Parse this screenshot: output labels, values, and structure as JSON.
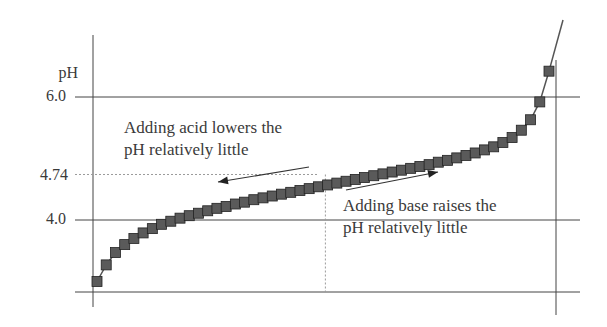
{
  "chart_data": {
    "type": "line",
    "title": "",
    "xlabel": "",
    "ylabel": "pH",
    "ylim": [
      2.83,
      7.0
    ],
    "y_ticks": [
      {
        "label": "6.0",
        "value": 6.0,
        "style": "solid"
      },
      {
        "label": "4.74",
        "value": 4.74,
        "style": "dashed"
      },
      {
        "label": "4.0",
        "value": 4.0,
        "style": "solid"
      }
    ],
    "grid": false,
    "legend": null,
    "marker": "square",
    "colors": {
      "marker_fill": "#5a5a5a",
      "marker_edge": "#222222",
      "line": "#555555",
      "axes": "#444444",
      "dashed": "#9a9a9a"
    },
    "series": [
      {
        "name": "buffer titration curve",
        "x": [
          0,
          1,
          2,
          3,
          4,
          5,
          6,
          7,
          8,
          9,
          10,
          11,
          12,
          13,
          14,
          15,
          16,
          17,
          18,
          19,
          20,
          21,
          22,
          23,
          24,
          25,
          26,
          27,
          28,
          29,
          30,
          31,
          32,
          33,
          34,
          35,
          36,
          37,
          38,
          39,
          40,
          41,
          42,
          43,
          44,
          45,
          46,
          47,
          48,
          49
        ],
        "values": [
          3.0,
          3.27,
          3.47,
          3.6,
          3.7,
          3.79,
          3.86,
          3.93,
          3.98,
          4.03,
          4.07,
          4.11,
          4.15,
          4.19,
          4.22,
          4.26,
          4.29,
          4.33,
          4.36,
          4.39,
          4.42,
          4.45,
          4.48,
          4.51,
          4.54,
          4.57,
          4.6,
          4.63,
          4.66,
          4.69,
          4.72,
          4.75,
          4.78,
          4.81,
          4.84,
          4.87,
          4.9,
          4.94,
          4.97,
          5.01,
          5.05,
          5.09,
          5.14,
          5.19,
          5.26,
          5.34,
          5.46,
          5.63,
          5.92,
          6.42
        ]
      }
    ],
    "end_line": {
      "from_value": 6.42,
      "to_value": 7.8
    },
    "reference_lines": [
      {
        "type": "horizontal",
        "value": 4.74,
        "style": "dashed"
      },
      {
        "type": "vertical",
        "at_index": 24,
        "from": 2.83,
        "to": 4.74,
        "style": "dashed"
      }
    ],
    "annotations": [
      {
        "text": [
          "Adding acid lowers the",
          "pH relatively little"
        ],
        "arrow": "left"
      },
      {
        "text": [
          "Adding base raises the",
          "pH relatively little"
        ],
        "arrow": "right"
      }
    ]
  },
  "labels": {
    "y_axis": "pH",
    "tick_6": "6.0",
    "tick_474": "4.74",
    "tick_4": "4.0",
    "acid_line1": "Adding acid lowers the",
    "acid_line2": "pH relatively little",
    "base_line1": "Adding base raises the",
    "base_line2": "pH relatively little"
  }
}
